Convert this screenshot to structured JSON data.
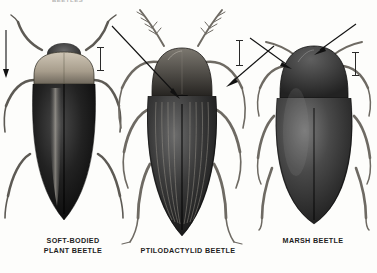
{
  "plate": {
    "kind": "scientific-illustration-plate",
    "view": "dorsal",
    "background_color": "#fdfdfb",
    "ink_color": "#111111",
    "top_cropped_text": "BEETLES"
  },
  "figures": [
    {
      "id": "soft-bodied-plant-beetle",
      "caption": "SOFT-BODIED\nPLANT BEETLE",
      "body_shape": "elongate-oval",
      "body_tone": "#171717",
      "pronotum_tone": "#bdb3a2",
      "notes": "dark elytra with pale median stripe; pale tan pronotum",
      "annotation": "arrow at antenna / head",
      "scale_bar_label": "I"
    },
    {
      "id": "ptilodactylid-beetle",
      "caption": "PTILODACTYLID BEETLE",
      "body_shape": "broad-oval-striate",
      "body_tone": "#2b2b2b",
      "pronotum_tone": "#4a4743",
      "notes": "elytra with strong longitudinal striae; pectinate antennae",
      "annotation": "arrow to scutellum; arrow to hind leg",
      "scale_bar_label": "I"
    },
    {
      "id": "marsh-beetle",
      "caption": "MARSH BEETLE",
      "body_shape": "broad-oval",
      "body_tone": "#3a3a3a",
      "pronotum_tone": "#2f2f2f",
      "notes": "smooth convex elytra; small scutellum notch",
      "annotation": "arrow to pronotum; arrow to antenna",
      "scale_bar_label": "I"
    }
  ],
  "scale_bars": {
    "glyph": "I",
    "count": 3,
    "meaning": "size reference"
  }
}
